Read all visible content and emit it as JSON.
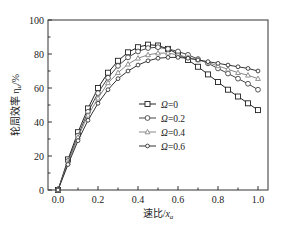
{
  "chart_data": {
    "type": "line",
    "title": "",
    "xlabel": "速比/x_a",
    "xlabel_main": "速比/",
    "xlabel_var": "x",
    "xlabel_sub": "a",
    "ylabel": "轮周效率 η_u/%",
    "ylabel_main": "轮周效率 η",
    "ylabel_sub": "u",
    "ylabel_unit": "/%",
    "xlim": [
      0.0,
      1.0
    ],
    "ylim": [
      0,
      100
    ],
    "xticks": [
      "0.0",
      "0.2",
      "0.4",
      "0.6",
      "0.8",
      "1.0"
    ],
    "yticks": [
      "0",
      "20",
      "40",
      "60",
      "80",
      "100"
    ],
    "grid": false,
    "legend_position": "center-left-inside",
    "x": [
      0.0,
      0.05,
      0.1,
      0.15,
      0.2,
      0.25,
      0.3,
      0.35,
      0.4,
      0.45,
      0.5,
      0.55,
      0.6,
      0.65,
      0.7,
      0.75,
      0.8,
      0.85,
      0.9,
      0.95,
      1.0
    ],
    "series": [
      {
        "name": "Ω=0",
        "marker": "square",
        "color": "#222222",
        "values": [
          0,
          18,
          34,
          48,
          60,
          69,
          76,
          81,
          84,
          85.5,
          85,
          83,
          80,
          76.5,
          72.5,
          68,
          63.5,
          59,
          55,
          51,
          47
        ]
      },
      {
        "name": "Ω=0.2",
        "marker": "circle",
        "color": "#444444",
        "values": [
          0,
          17,
          32,
          46,
          57,
          66,
          73,
          78,
          81.5,
          83.5,
          84,
          83,
          81.5,
          79.5,
          77,
          74.5,
          71.5,
          68.5,
          65.5,
          62.5,
          59
        ]
      },
      {
        "name": "Ω=0.4",
        "marker": "triangle",
        "color": "#888888",
        "values": [
          0,
          16,
          31,
          44,
          54,
          63,
          69,
          74,
          77.5,
          79.5,
          80.5,
          80.5,
          79.5,
          78,
          76.5,
          75,
          73,
          71,
          69,
          67.5,
          65.5
        ]
      },
      {
        "name": "Ω=0.6",
        "marker": "circle-small",
        "color": "#333333",
        "values": [
          0,
          15,
          29,
          41,
          51,
          59,
          65.5,
          70,
          73.5,
          76,
          77.5,
          78,
          78,
          77.5,
          76.5,
          75.5,
          74.5,
          73.5,
          72.5,
          71.5,
          70
        ]
      }
    ]
  },
  "legend": {
    "items": [
      {
        "symbol": "Ω",
        "value": "=0"
      },
      {
        "symbol": "Ω",
        "value": "=0.2"
      },
      {
        "symbol": "Ω",
        "value": "=0.4"
      },
      {
        "symbol": "Ω",
        "value": "=0.6"
      }
    ]
  }
}
